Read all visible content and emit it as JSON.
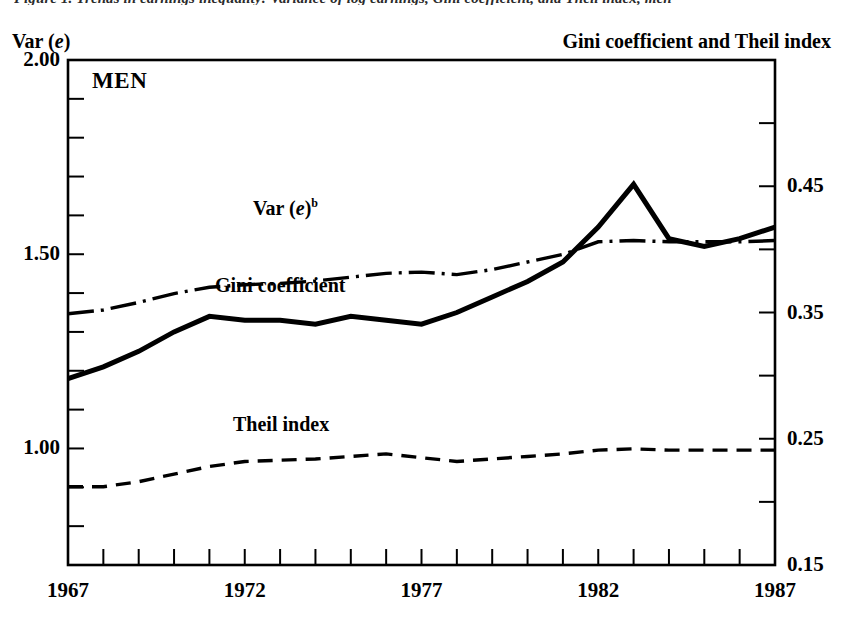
{
  "figure": {
    "running_title": "Figure 1.  Trends in earnings inequality: Variance of log earnings, Gini coefficient, and Theil index, men",
    "panel_label": "MEN",
    "left_axis_title": "Var (e)",
    "right_axis_title": "Gini coefficient and Theil index"
  },
  "chart_data": {
    "type": "line",
    "title": "",
    "xlabel": "",
    "ylabel": "Var (e)",
    "y2label": "Gini coefficient and Theil index",
    "grid": false,
    "legend": "inline-labels",
    "xlim": [
      1967,
      1987
    ],
    "xticks": [
      1967,
      1972,
      1977,
      1982,
      1987
    ],
    "xtick_labels": [
      "1967",
      "1972",
      "1977",
      "1982",
      "1987"
    ],
    "x_minor_tick_interval": 1,
    "ylim": [
      0.7,
      2.0
    ],
    "yticks": [
      1.0,
      1.5,
      2.0
    ],
    "ytick_labels": [
      "1.00",
      "1.50",
      "2.00"
    ],
    "y_minor_tick_interval": 0.1,
    "y2lim": [
      0.15,
      0.55
    ],
    "y2ticks": [
      0.15,
      0.25,
      0.35,
      0.45
    ],
    "y2tick_labels": [
      "0.15",
      "0.25",
      "0.35",
      "0.45"
    ],
    "y2_minor_tick_interval": 0.05,
    "x": [
      1967,
      1968,
      1969,
      1970,
      1971,
      1972,
      1973,
      1974,
      1975,
      1976,
      1977,
      1978,
      1979,
      1980,
      1981,
      1982,
      1983,
      1984,
      1985,
      1986,
      1987
    ],
    "series": [
      {
        "name": "Var (e)",
        "label": "Var (e)b",
        "axis": "left",
        "style": "solid-thick",
        "values": [
          1.18,
          1.21,
          1.25,
          1.3,
          1.34,
          1.33,
          1.33,
          1.32,
          1.34,
          1.33,
          1.32,
          1.35,
          1.39,
          1.43,
          1.48,
          1.57,
          1.68,
          1.54,
          1.52,
          1.54,
          1.57
        ]
      },
      {
        "name": "Gini coefficient",
        "label": "Gini coefficient",
        "axis": "right",
        "style": "dash-dot",
        "values": [
          0.349,
          0.352,
          0.358,
          0.365,
          0.37,
          0.372,
          0.373,
          0.375,
          0.378,
          0.381,
          0.382,
          0.38,
          0.384,
          0.39,
          0.396,
          0.406,
          0.407,
          0.406,
          0.406,
          0.406,
          0.407
        ]
      },
      {
        "name": "Theil index",
        "label": "Theil index",
        "axis": "right",
        "style": "dashed",
        "values": [
          0.212,
          0.212,
          0.216,
          0.222,
          0.228,
          0.232,
          0.233,
          0.234,
          0.236,
          0.238,
          0.235,
          0.232,
          0.234,
          0.236,
          0.238,
          0.241,
          0.242,
          0.241,
          0.241,
          0.241,
          0.241
        ]
      }
    ],
    "annotations": [
      {
        "text": "MEN",
        "x": 1967.7,
        "note": "panel label, top-left inside frame"
      }
    ]
  },
  "colors": {
    "line": "#000000",
    "frame": "#000000",
    "background": "#ffffff"
  }
}
